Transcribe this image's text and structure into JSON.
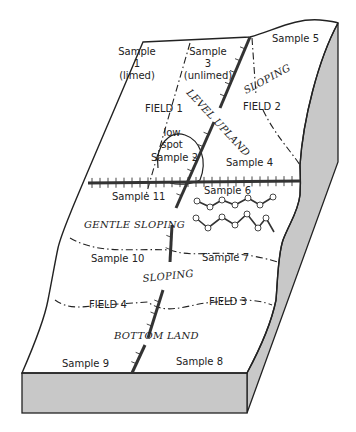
{
  "figure": {
    "samples": [
      {
        "id": "sample-1",
        "lines": [
          "Sample",
          "1",
          "(limed)"
        ]
      },
      {
        "id": "sample-3",
        "lines": [
          "Sample",
          "3",
          "(unlimed)"
        ]
      },
      {
        "id": "sample-5",
        "lines": [
          "Sample 5"
        ]
      },
      {
        "id": "sample-2",
        "lines": [
          "Sample 2"
        ]
      },
      {
        "id": "sample-4",
        "lines": [
          "Sample 4"
        ]
      },
      {
        "id": "sample-11",
        "lines": [
          "Sample 11"
        ]
      },
      {
        "id": "sample-6",
        "lines": [
          "Sample 6"
        ]
      },
      {
        "id": "sample-10",
        "lines": [
          "Sample 10"
        ]
      },
      {
        "id": "sample-7",
        "lines": [
          "Sample 7"
        ]
      },
      {
        "id": "sample-9",
        "lines": [
          "Sample 9"
        ]
      },
      {
        "id": "sample-8",
        "lines": [
          "Sample 8"
        ]
      }
    ],
    "fields": {
      "field1": "FIELD 1",
      "field2": "FIELD 2",
      "field3": "FIELD 3",
      "field4": "FIELD 4"
    },
    "landforms": {
      "level_upland": "LEVEL UPLAND",
      "sloping_top": "SLOPING",
      "gentle_sloping": "GENTLE SLOPING",
      "sloping_mid": "SLOPING",
      "bottom_land": "BOTTOM LAND"
    },
    "features": {
      "low_spot_line1": "low",
      "low_spot_line2": "spot"
    },
    "colors": {
      "surface": "#ffffff",
      "side_face": "#c8c8c8",
      "ink": "#222222"
    }
  }
}
